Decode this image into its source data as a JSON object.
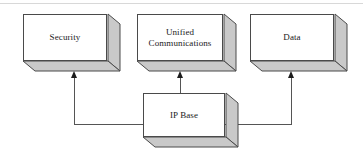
{
  "diagram": {
    "style": {
      "box_face_color": "#ffffff",
      "box_edge_color": "#4a4a4a",
      "box_shade_color": "#c9c9c9",
      "connector_color": "#555555",
      "arrow_color": "#1c1c1c",
      "text_color": "#1a1a1a",
      "background_color": "#ffffff",
      "frame_line_color": "#d8d8d8"
    },
    "top_boxes": [
      {
        "id": "security",
        "label": "Security",
        "font_size_px": 9
      },
      {
        "id": "unified-communications",
        "label": "Unified\nCommunications",
        "font_size_px": 9
      },
      {
        "id": "data",
        "label": "Data",
        "font_size_px": 9
      }
    ],
    "base_box": {
      "id": "ip-base",
      "label": "IP Base",
      "font_size_px": 9
    },
    "connectors": [
      {
        "id": "ip-base-to-security",
        "from": "ip-base",
        "to": "security",
        "direction": "up",
        "arrow": true
      },
      {
        "id": "ip-base-to-unified-communications",
        "from": "ip-base",
        "to": "unified-communications",
        "direction": "up",
        "arrow": true
      },
      {
        "id": "ip-base-to-data",
        "from": "ip-base",
        "to": "data",
        "direction": "up",
        "arrow": true
      }
    ]
  }
}
